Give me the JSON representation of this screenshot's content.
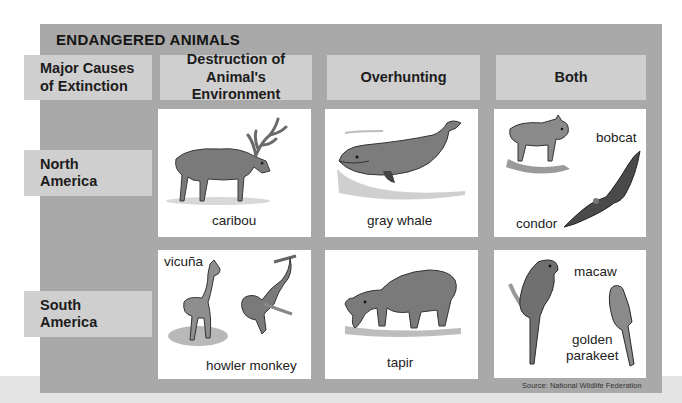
{
  "title": "ENDANGERED ANIMALS",
  "corner_header": [
    "Major Causes",
    "of Extinction"
  ],
  "columns": [
    {
      "label_lines": [
        "Destruction of",
        "Animal's Environment"
      ]
    },
    {
      "label_lines": [
        "Overhunting"
      ]
    },
    {
      "label_lines": [
        "Both"
      ]
    }
  ],
  "rows": [
    {
      "label_lines": [
        "North",
        "America"
      ],
      "cells": [
        {
          "animals": [
            "caribou"
          ]
        },
        {
          "animals": [
            "gray whale"
          ]
        },
        {
          "animals": [
            "bobcat",
            "condor"
          ]
        }
      ]
    },
    {
      "label_lines": [
        "South",
        "America"
      ],
      "cells": [
        {
          "animals": [
            "vicuña",
            "howler monkey"
          ]
        },
        {
          "animals": [
            "tapir"
          ]
        },
        {
          "animals": [
            "macaw",
            "golden parakeet"
          ]
        }
      ]
    }
  ],
  "golden_parakeet_lines": [
    "golden",
    "parakeet"
  ],
  "source": "Source: National Wildlife Federation",
  "colors": {
    "panel": "#a9a9a9",
    "header_cell": "#cfcfcf",
    "card": "#ffffff",
    "text": "#1c1c1c"
  },
  "icons": {
    "caribou": "caribou-illustration",
    "gray_whale": "whale-illustration",
    "bobcat": "bobcat-illustration",
    "condor": "condor-illustration",
    "vicuna": "vicuna-illustration",
    "howler_monkey": "monkey-illustration",
    "tapir": "tapir-illustration",
    "macaw": "macaw-illustration",
    "golden_parakeet": "parakeet-illustration"
  }
}
